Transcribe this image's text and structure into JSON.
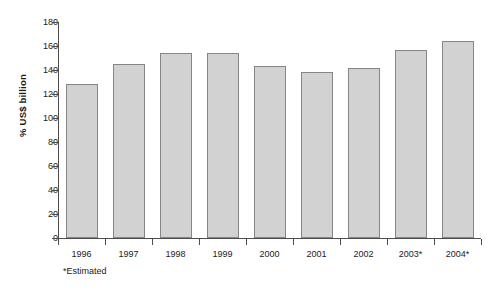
{
  "chart_data": {
    "type": "bar",
    "title": "",
    "xlabel": "",
    "ylabel": "% US$ billion",
    "categories": [
      "1996",
      "1997",
      "1998",
      "1999",
      "2000",
      "2001",
      "2002",
      "2003*",
      "2004*"
    ],
    "values": [
      128,
      145,
      154,
      154,
      143,
      138,
      142,
      157,
      164
    ],
    "ylim": [
      0,
      180
    ],
    "yticks": [
      0,
      20,
      40,
      60,
      80,
      100,
      120,
      140,
      160,
      180
    ],
    "ytick_labels": [
      "0",
      "20",
      "40",
      "60",
      "80",
      "100",
      "120",
      "140",
      "160",
      "180"
    ],
    "grid": false,
    "legend": null,
    "footnote": "*Estimated",
    "bar_color": "#d2d2d2",
    "bar_border_color": "#868686",
    "axis_color": "#4d4d4d",
    "background": "#ffffff"
  }
}
